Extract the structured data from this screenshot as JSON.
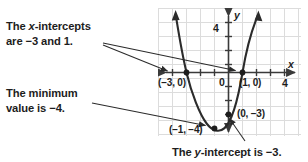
{
  "figure": {
    "kind": "coordinate-plane-quadratic-graph",
    "annotations": [
      {
        "id": "x-intercepts",
        "line1": "The x-intercepts",
        "line2": "are −3 and 1."
      },
      {
        "id": "minimum",
        "line1": "The minimum",
        "line2": "value is −4."
      },
      {
        "id": "y-intercept",
        "line1": "The y-intercept is −3.",
        "line2": ""
      }
    ],
    "axes": {
      "x_axis_label": "x",
      "y_axis_label": "y",
      "origin_label": "0",
      "x_tick_label": "4",
      "y_tick_label": "4",
      "x_range": [
        -5,
        5
      ],
      "y_range": [
        -5,
        5
      ],
      "grid": true,
      "grid_color": "#d9d9d9",
      "axis_color": "#3a3a3a"
    },
    "point_labels": [
      {
        "id": "x-intercept-left",
        "text": "(−3, 0)"
      },
      {
        "id": "x-intercept-right",
        "text": "(1, 0)"
      },
      {
        "id": "vertex",
        "text": "(−1, −4)"
      },
      {
        "id": "y-intercept",
        "text": "(0, −3)"
      }
    ]
  },
  "chart_data": {
    "type": "line",
    "title": "",
    "xlabel": "x",
    "ylabel": "y",
    "xlim": [
      -5,
      5
    ],
    "ylim": [
      -5,
      5
    ],
    "grid": true,
    "legend": "none",
    "function": "y = x^2 + 2x - 3",
    "series": [
      {
        "name": "parabola",
        "x": [
          -3.8,
          -3.5,
          -3.0,
          -2.5,
          -2.0,
          -1.5,
          -1.0,
          -0.5,
          0.0,
          0.5,
          1.0,
          1.5,
          1.8
        ],
        "y": [
          4.04,
          2.25,
          0.0,
          -2.0,
          -3.0,
          -3.75,
          -4.0,
          -3.75,
          -3.0,
          -1.75,
          0.0,
          2.25,
          3.84
        ]
      }
    ],
    "annotated_points": [
      {
        "label": "(−3, 0)",
        "x": -3,
        "y": 0,
        "role": "x-intercept"
      },
      {
        "label": "(1, 0)",
        "x": 1,
        "y": 0,
        "role": "x-intercept"
      },
      {
        "label": "(−1, −4)",
        "x": -1,
        "y": -4,
        "role": "vertex-minimum"
      },
      {
        "label": "(0, −3)",
        "x": 0,
        "y": -3,
        "role": "y-intercept"
      }
    ],
    "tick_labels": {
      "x": [
        "4"
      ],
      "y": [
        "4"
      ],
      "origin": "0"
    }
  }
}
